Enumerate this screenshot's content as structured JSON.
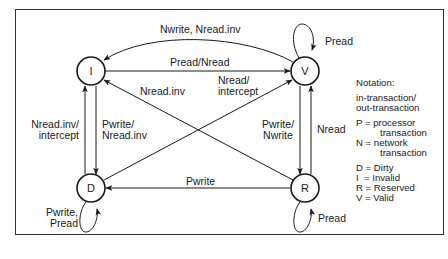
{
  "diagram": {
    "type": "state-transition",
    "states": [
      {
        "id": "I",
        "label": "I",
        "name": "Invalid"
      },
      {
        "id": "V",
        "label": "V",
        "name": "Valid"
      },
      {
        "id": "D",
        "label": "D",
        "name": "Dirty"
      },
      {
        "id": "R",
        "label": "R",
        "name": "Reserved"
      }
    ],
    "transitions": [
      {
        "from": "V",
        "to": "I",
        "label": "Nwrite, Nread.inv"
      },
      {
        "from": "V",
        "to": "V",
        "label": "Pread"
      },
      {
        "from": "I",
        "to": "V",
        "label": "Pread/Nread"
      },
      {
        "from": "R",
        "to": "I",
        "label": "Nread.inv"
      },
      {
        "from": "D",
        "to": "V",
        "label_line1": "Nread/",
        "label_line2": "intercept"
      },
      {
        "from": "D",
        "to": "I",
        "label_line1": "Nread.inv/",
        "label_line2": "intercept"
      },
      {
        "from": "I",
        "to": "D",
        "label_line1": "Pwrite/",
        "label_line2": "Nread.inv"
      },
      {
        "from": "V",
        "to": "R",
        "label_line1": "Pwrite/",
        "label_line2": "Nwrite"
      },
      {
        "from": "R",
        "to": "V",
        "label": "Nread"
      },
      {
        "from": "R",
        "to": "D",
        "label": "Pwrite"
      },
      {
        "from": "D",
        "to": "D",
        "label_line1": "Pwrite,",
        "label_line2": "Pread"
      },
      {
        "from": "R",
        "to": "R",
        "label": "Pread"
      }
    ]
  },
  "notation": {
    "title": "Notation:",
    "format_line1": "in-transaction/",
    "format_line2": "out-transaction",
    "p_line1": "P = processor",
    "p_line2": "transaction",
    "n_line1": "N = network",
    "n_line2": "transaction",
    "d": "D = Dirty",
    "i": "I  = Invalid",
    "r": "R = Reserved",
    "v": "V = Valid"
  }
}
